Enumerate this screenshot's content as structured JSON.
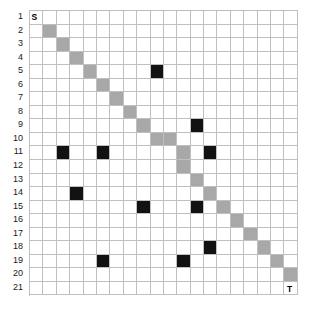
{
  "figure": {
    "kind": "grid-path-diagram",
    "rows": 21,
    "cols": 20,
    "row_labels": [
      "1",
      "2",
      "3",
      "4",
      "5",
      "6",
      "7",
      "8",
      "9",
      "10",
      "11",
      "12",
      "13",
      "14",
      "15",
      "16",
      "17",
      "18",
      "19",
      "20",
      "21"
    ],
    "start_label": "S",
    "target_label": "T",
    "start_cell": [
      1,
      1
    ],
    "target_cell": [
      21,
      20
    ],
    "colors": {
      "grid_line": "#bfbfbf",
      "background": "#ffffff",
      "path_cell": "#a8a8a8",
      "blocked_cell": "#121212",
      "label_text": "#1a1a1a"
    }
  },
  "chart_data": {
    "type": "heatmap",
    "title": "",
    "xlabel": "",
    "ylabel": "",
    "grid": true,
    "legend": "none",
    "rows": 21,
    "cols": 20,
    "row_ticks": [
      "1",
      "2",
      "3",
      "4",
      "5",
      "6",
      "7",
      "8",
      "9",
      "10",
      "11",
      "12",
      "13",
      "14",
      "15",
      "16",
      "17",
      "18",
      "19",
      "20",
      "21"
    ],
    "col_ticks": [],
    "categories_legend": [
      {
        "name": "empty",
        "color": "#ffffff"
      },
      {
        "name": "path",
        "color": "#a8a8a8"
      },
      {
        "name": "blocked",
        "color": "#121212"
      }
    ],
    "annotations": [
      {
        "text": "S",
        "row": 1,
        "col": 1
      },
      {
        "text": "T",
        "row": 21,
        "col": 20
      }
    ],
    "path_cells": [
      [
        2,
        2
      ],
      [
        3,
        3
      ],
      [
        4,
        4
      ],
      [
        5,
        5
      ],
      [
        6,
        6
      ],
      [
        7,
        7
      ],
      [
        8,
        8
      ],
      [
        9,
        9
      ],
      [
        10,
        10
      ],
      [
        10,
        11
      ],
      [
        11,
        12
      ],
      [
        12,
        12
      ],
      [
        13,
        13
      ],
      [
        14,
        14
      ],
      [
        15,
        15
      ],
      [
        16,
        16
      ],
      [
        17,
        17
      ],
      [
        18,
        18
      ],
      [
        19,
        19
      ],
      [
        20,
        20
      ]
    ],
    "blocked_cells": [
      [
        5,
        10
      ],
      [
        9,
        13
      ],
      [
        11,
        3
      ],
      [
        11,
        6
      ],
      [
        11,
        14
      ],
      [
        14,
        4
      ],
      [
        15,
        9
      ],
      [
        15,
        13
      ],
      [
        18,
        14
      ],
      [
        19,
        6
      ],
      [
        19,
        12
      ]
    ],
    "values": [
      [
        0,
        0,
        0,
        0,
        0,
        0,
        0,
        0,
        0,
        0,
        0,
        0,
        0,
        0,
        0,
        0,
        0,
        0,
        0,
        0
      ],
      [
        0,
        1,
        0,
        0,
        0,
        0,
        0,
        0,
        0,
        0,
        0,
        0,
        0,
        0,
        0,
        0,
        0,
        0,
        0,
        0
      ],
      [
        0,
        0,
        1,
        0,
        0,
        0,
        0,
        0,
        0,
        0,
        0,
        0,
        0,
        0,
        0,
        0,
        0,
        0,
        0,
        0
      ],
      [
        0,
        0,
        0,
        1,
        0,
        0,
        0,
        0,
        0,
        0,
        0,
        0,
        0,
        0,
        0,
        0,
        0,
        0,
        0,
        0
      ],
      [
        0,
        0,
        0,
        0,
        1,
        0,
        0,
        0,
        0,
        2,
        0,
        0,
        0,
        0,
        0,
        0,
        0,
        0,
        0,
        0
      ],
      [
        0,
        0,
        0,
        0,
        0,
        1,
        0,
        0,
        0,
        0,
        0,
        0,
        0,
        0,
        0,
        0,
        0,
        0,
        0,
        0
      ],
      [
        0,
        0,
        0,
        0,
        0,
        0,
        1,
        0,
        0,
        0,
        0,
        0,
        0,
        0,
        0,
        0,
        0,
        0,
        0,
        0
      ],
      [
        0,
        0,
        0,
        0,
        0,
        0,
        0,
        1,
        0,
        0,
        0,
        0,
        0,
        0,
        0,
        0,
        0,
        0,
        0,
        0
      ],
      [
        0,
        0,
        0,
        0,
        0,
        0,
        0,
        0,
        1,
        0,
        0,
        0,
        2,
        0,
        0,
        0,
        0,
        0,
        0,
        0
      ],
      [
        0,
        0,
        0,
        0,
        0,
        0,
        0,
        0,
        0,
        1,
        1,
        0,
        0,
        0,
        0,
        0,
        0,
        0,
        0,
        0
      ],
      [
        0,
        0,
        2,
        0,
        0,
        2,
        0,
        0,
        0,
        0,
        0,
        1,
        0,
        2,
        0,
        0,
        0,
        0,
        0,
        0
      ],
      [
        0,
        0,
        0,
        0,
        0,
        0,
        0,
        0,
        0,
        0,
        0,
        1,
        0,
        0,
        0,
        0,
        0,
        0,
        0,
        0
      ],
      [
        0,
        0,
        0,
        0,
        0,
        0,
        0,
        0,
        0,
        0,
        0,
        0,
        1,
        0,
        0,
        0,
        0,
        0,
        0,
        0
      ],
      [
        0,
        0,
        0,
        2,
        0,
        0,
        0,
        0,
        0,
        0,
        0,
        0,
        0,
        1,
        0,
        0,
        0,
        0,
        0,
        0
      ],
      [
        0,
        0,
        0,
        0,
        0,
        0,
        0,
        0,
        2,
        0,
        0,
        0,
        2,
        0,
        1,
        0,
        0,
        0,
        0,
        0
      ],
      [
        0,
        0,
        0,
        0,
        0,
        0,
        0,
        0,
        0,
        0,
        0,
        0,
        0,
        0,
        0,
        1,
        0,
        0,
        0,
        0
      ],
      [
        0,
        0,
        0,
        0,
        0,
        0,
        0,
        0,
        0,
        0,
        0,
        0,
        0,
        0,
        0,
        0,
        1,
        0,
        0,
        0
      ],
      [
        0,
        0,
        0,
        0,
        0,
        0,
        0,
        0,
        0,
        0,
        0,
        0,
        0,
        2,
        0,
        0,
        0,
        1,
        0,
        0
      ],
      [
        0,
        0,
        0,
        0,
        0,
        2,
        0,
        0,
        0,
        0,
        0,
        2,
        0,
        0,
        0,
        0,
        0,
        0,
        1,
        0
      ],
      [
        0,
        0,
        0,
        0,
        0,
        0,
        0,
        0,
        0,
        0,
        0,
        0,
        0,
        0,
        0,
        0,
        0,
        0,
        0,
        1
      ],
      [
        0,
        0,
        0,
        0,
        0,
        0,
        0,
        0,
        0,
        0,
        0,
        0,
        0,
        0,
        0,
        0,
        0,
        0,
        0,
        0
      ]
    ],
    "value_legend": {
      "0": "empty",
      "1": "path",
      "2": "blocked"
    }
  }
}
